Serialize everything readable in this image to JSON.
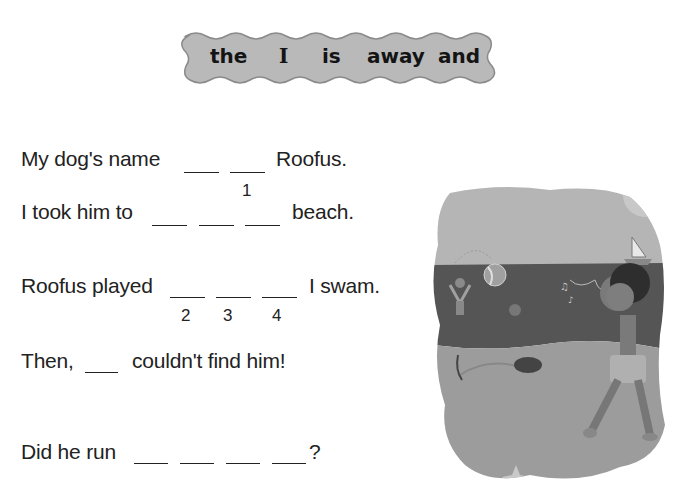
{
  "word_bank": {
    "words": [
      "the",
      "I",
      "is",
      "away",
      "and"
    ],
    "fill_color": "#b9b9b9",
    "border_color": "#8a8a8a"
  },
  "sentences": [
    {
      "before": "My dog's name",
      "blanks": 2,
      "after": "Roofus.",
      "numbers": [
        "",
        "1"
      ]
    },
    {
      "before": "I took him to",
      "blanks": 3,
      "after": "beach.",
      "numbers": [
        "",
        "",
        ""
      ]
    },
    {
      "before": "Roofus played",
      "blanks": 3,
      "after": "I swam.",
      "numbers": [
        "2",
        "3",
        "4"
      ]
    },
    {
      "before": "Then,",
      "blanks": 1,
      "after": "couldn't find him!",
      "numbers": [
        ""
      ]
    },
    {
      "before": "Did he run",
      "blanks": 4,
      "after": "?",
      "numbers": [
        "",
        "",
        "",
        ""
      ]
    }
  ],
  "illustration": {
    "description": "Grayscale beach scene: boy walking and whistling, dog digging in sand, beach ball, sailboat, swimmer waving, starfish",
    "colors": {
      "sky": "#b5b5b5",
      "sea": "#555555",
      "sand": "#9c9c9c"
    }
  }
}
